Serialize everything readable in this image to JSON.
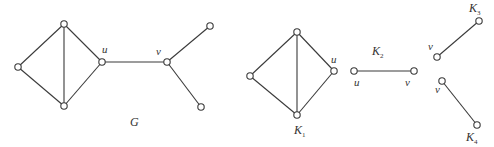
{
  "colors": {
    "line": "#3a3a3a",
    "node_fill": "#ffffff",
    "text": "#333333"
  },
  "graphs": [
    {
      "id": "G",
      "label": "G",
      "label_pos": [
        130,
        126
      ],
      "nodes": [
        {
          "id": "g_left",
          "x": 18,
          "y": 67,
          "label": ""
        },
        {
          "id": "g_top",
          "x": 64,
          "y": 24,
          "label": ""
        },
        {
          "id": "g_bottom",
          "x": 64,
          "y": 106,
          "label": ""
        },
        {
          "id": "g_u",
          "x": 102,
          "y": 62,
          "label": "u",
          "label_pos": [
            102,
            53
          ]
        },
        {
          "id": "g_v",
          "x": 167,
          "y": 62,
          "label": "v",
          "label_pos": [
            156,
            55
          ]
        },
        {
          "id": "g_tr",
          "x": 210,
          "y": 26,
          "label": ""
        },
        {
          "id": "g_br",
          "x": 201,
          "y": 107,
          "label": ""
        }
      ],
      "edges": [
        [
          "g_left",
          "g_top"
        ],
        [
          "g_left",
          "g_bottom"
        ],
        [
          "g_top",
          "g_bottom"
        ],
        [
          "g_top",
          "g_u"
        ],
        [
          "g_bottom",
          "g_u"
        ],
        [
          "g_u",
          "g_v"
        ],
        [
          "g_v",
          "g_tr"
        ],
        [
          "g_v",
          "g_br"
        ]
      ]
    },
    {
      "id": "K1",
      "label": "K",
      "sub": "1",
      "label_pos": [
        294,
        134
      ],
      "nodes": [
        {
          "id": "k1_left",
          "x": 250,
          "y": 76,
          "label": ""
        },
        {
          "id": "k1_top",
          "x": 297,
          "y": 32,
          "label": ""
        },
        {
          "id": "k1_bottom",
          "x": 297,
          "y": 115,
          "label": ""
        },
        {
          "id": "k1_u",
          "x": 334,
          "y": 71,
          "label": "u",
          "label_pos": [
            331,
            63
          ]
        }
      ],
      "edges": [
        [
          "k1_left",
          "k1_top"
        ],
        [
          "k1_left",
          "k1_bottom"
        ],
        [
          "k1_top",
          "k1_bottom"
        ],
        [
          "k1_top",
          "k1_u"
        ],
        [
          "k1_bottom",
          "k1_u"
        ]
      ]
    },
    {
      "id": "K2",
      "label": "K",
      "sub": "2",
      "label_pos": [
        372,
        55
      ],
      "nodes": [
        {
          "id": "k2_u",
          "x": 354,
          "y": 71,
          "label": "u",
          "label_pos": [
            354,
            86
          ]
        },
        {
          "id": "k2_v",
          "x": 414,
          "y": 71,
          "label": "v",
          "label_pos": [
            405,
            86
          ]
        }
      ],
      "edges": [
        [
          "k2_u",
          "k2_v"
        ]
      ]
    },
    {
      "id": "K3",
      "label": "K",
      "sub": "3",
      "label_pos": [
        469,
        12
      ],
      "nodes": [
        {
          "id": "k3_v",
          "x": 437,
          "y": 57,
          "label": "v",
          "label_pos": [
            428,
            50
          ]
        },
        {
          "id": "k3_top",
          "x": 479,
          "y": 21,
          "label": ""
        }
      ],
      "edges": [
        [
          "k3_v",
          "k3_top"
        ]
      ]
    },
    {
      "id": "K4",
      "label": "K",
      "sub": "4",
      "label_pos": [
        466,
        141
      ],
      "nodes": [
        {
          "id": "k4_v",
          "x": 442,
          "y": 81,
          "label": "v",
          "label_pos": [
            435,
            93
          ]
        },
        {
          "id": "k4_bottom",
          "x": 477,
          "y": 125,
          "label": ""
        }
      ],
      "edges": [
        [
          "k4_v",
          "k4_bottom"
        ]
      ]
    }
  ]
}
